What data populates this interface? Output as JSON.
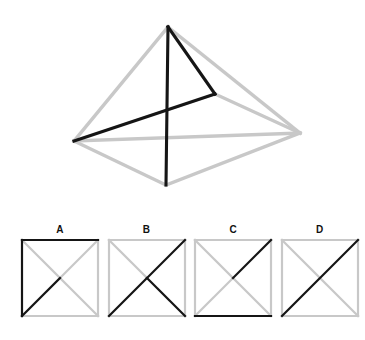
{
  "puzzle": {
    "title": "Pyramid wireframe with four square diagram options",
    "colors": {
      "stroke_dark": "#151515",
      "stroke_light": "#c8c8c8",
      "background": "#ffffff",
      "label": "#111111"
    }
  },
  "figure": {
    "name": "pyramid-wireframe",
    "viewbox": "0 0 365 215",
    "vertices": {
      "apex": [
        168,
        27
      ],
      "left": [
        74,
        141
      ],
      "right": [
        300,
        133
      ],
      "front_bottom": [
        166,
        185
      ],
      "mid_right": [
        215,
        94
      ]
    },
    "light_edges": [
      {
        "name": "apex-to-left",
        "d": "M168,27 L74,141"
      },
      {
        "name": "apex-to-right",
        "d": "M168,27 L300,133"
      },
      {
        "name": "apex-to-front",
        "d": "M168,27 L215,94 L300,133"
      },
      {
        "name": "left-to-front-bottom",
        "d": "M74,141 L166,185"
      },
      {
        "name": "front-bottom-to-right",
        "d": "M166,185 L300,133"
      },
      {
        "name": "left-to-right-back",
        "d": "M74,141 L300,133"
      }
    ],
    "dark_edges": [
      {
        "name": "apex-to-front-bottom-vertical",
        "d": "M168,27 L166,185"
      },
      {
        "name": "apex-to-mid-right",
        "d": "M168,27 L215,94"
      },
      {
        "name": "mid-right-to-left",
        "d": "M215,94 L74,141"
      }
    ]
  },
  "options": [
    {
      "label": "A",
      "name": "option-a",
      "dark_edges": [
        {
          "name": "top-edge",
          "d": "M2,2 L78,2"
        },
        {
          "name": "left-edge",
          "d": "M2,2 L2,78"
        },
        {
          "name": "bottom-left-to-center-diagonal",
          "d": "M2,78 L40,40"
        }
      ],
      "light_edges": [
        {
          "name": "right-edge",
          "d": "M78,2 L78,78"
        },
        {
          "name": "bottom-edge",
          "d": "M2,78 L78,78"
        },
        {
          "name": "main-diagonal",
          "d": "M2,2 L78,78"
        },
        {
          "name": "anti-diagonal",
          "d": "M78,2 L2,78"
        }
      ]
    },
    {
      "label": "B",
      "name": "option-b",
      "dark_edges": [
        {
          "name": "anti-diagonal-full",
          "d": "M78,2 L2,78"
        },
        {
          "name": "center-to-bottom-right-diagonal",
          "d": "M40,40 L78,78"
        }
      ],
      "light_edges": [
        {
          "name": "top-edge",
          "d": "M2,2 L78,2"
        },
        {
          "name": "left-edge",
          "d": "M2,2 L2,78"
        },
        {
          "name": "right-edge",
          "d": "M78,2 L78,78"
        },
        {
          "name": "bottom-edge",
          "d": "M2,78 L78,78"
        },
        {
          "name": "top-left-to-center-diagonal",
          "d": "M2,2 L40,40"
        }
      ]
    },
    {
      "label": "C",
      "name": "option-c",
      "dark_edges": [
        {
          "name": "center-to-top-right-diagonal",
          "d": "M40,40 L78,2"
        },
        {
          "name": "bottom-edge",
          "d": "M2,78 L78,78"
        }
      ],
      "light_edges": [
        {
          "name": "top-edge",
          "d": "M2,2 L78,2"
        },
        {
          "name": "left-edge",
          "d": "M2,2 L2,78"
        },
        {
          "name": "right-edge",
          "d": "M78,2 L78,78"
        },
        {
          "name": "main-diagonal",
          "d": "M2,2 L78,78"
        },
        {
          "name": "center-to-bottom-left-diagonal",
          "d": "M40,40 L2,78"
        }
      ]
    },
    {
      "label": "D",
      "name": "option-d",
      "dark_edges": [
        {
          "name": "anti-diagonal-full",
          "d": "M78,2 L2,78"
        }
      ],
      "light_edges": [
        {
          "name": "top-edge",
          "d": "M2,2 L78,2"
        },
        {
          "name": "left-edge",
          "d": "M2,2 L2,78"
        },
        {
          "name": "right-edge",
          "d": "M78,2 L78,78"
        },
        {
          "name": "bottom-edge",
          "d": "M2,78 L78,78"
        },
        {
          "name": "main-diagonal",
          "d": "M2,2 L78,78"
        }
      ]
    }
  ]
}
